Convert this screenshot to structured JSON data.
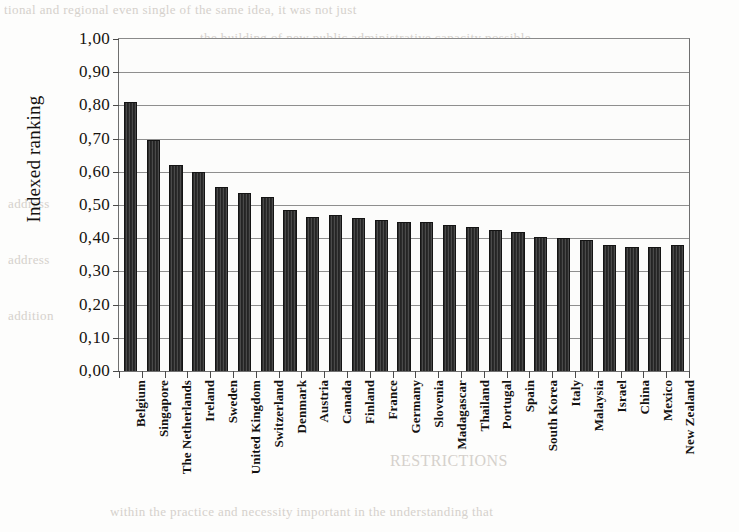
{
  "figure": {
    "background_color": "#fdfdfc",
    "bar_color": "#303030",
    "gridline_color": "#8e8e8e",
    "axis_color": "#6f6f6f"
  },
  "bleed_through_text": {
    "line1": "tional and regional even single of the same idea, it was not just",
    "line2": "the building of new public administrative capacity possible",
    "line3": "nations, but rather and therefore significant the",
    "line4": "educational and scientific and technical capabilities in",
    "line5": "research capability, which were in part the institutions",
    "line6": "these developments touched the labour",
    "line7": "is presented to discussion of",
    "line8": "address",
    "line9": "address",
    "line10": "addition",
    "line11": "RESTRICTIONS",
    "line12": "within the practice and necessity important in the understanding that"
  },
  "chart_data": {
    "type": "bar",
    "title": "",
    "subtitle": "",
    "xlabel": "",
    "ylabel": "Indexed ranking",
    "ylim": [
      0.0,
      1.0
    ],
    "ytick_step": 0.1,
    "grid": true,
    "grid_axis": "y",
    "legend": false,
    "legend_position": "none",
    "decimal_separator": ",",
    "ytick_labels": [
      "1,00",
      "0,90",
      "0,80",
      "0,70",
      "0,60",
      "0,50",
      "0,40",
      "0,30",
      "0,20",
      "0,10",
      "0,00"
    ],
    "ytick_values": [
      1.0,
      0.9,
      0.8,
      0.7,
      0.6,
      0.5,
      0.4,
      0.3,
      0.2,
      0.1,
      0.0
    ],
    "categories": [
      "Belgium",
      "Singapore",
      "The Netherlands",
      "Ireland",
      "Sweden",
      "United Kingdom",
      "Switzerland",
      "Denmark",
      "Austria",
      "Canada",
      "Finland",
      "France",
      "Germany",
      "Slovenia",
      "Madagascar",
      "Thailand",
      "Portugal",
      "Spain",
      "South Korea",
      "Italy",
      "Malaysia",
      "Israel",
      "China",
      "Mexico",
      "New Zealand"
    ],
    "values": [
      0.81,
      0.695,
      0.62,
      0.6,
      0.555,
      0.535,
      0.525,
      0.485,
      0.465,
      0.47,
      0.46,
      0.455,
      0.45,
      0.45,
      0.44,
      0.435,
      0.425,
      0.42,
      0.405,
      0.4,
      0.395,
      0.38,
      0.375,
      0.375,
      0.38
    ]
  }
}
